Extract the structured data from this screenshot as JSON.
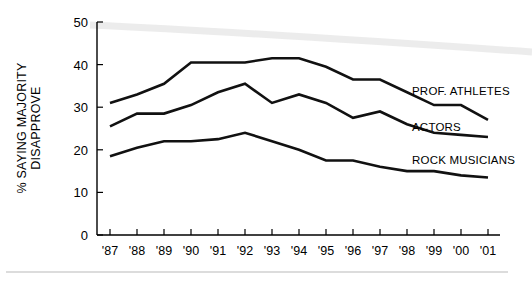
{
  "chart_data": {
    "type": "line",
    "title": "",
    "subtitle": "",
    "xlabel": "",
    "ylabel": "% SAYING MAJORITY DISAPPROVE",
    "ylabel_line1": "% SAYING MAJORITY",
    "ylabel_line2": "DISAPPROVE",
    "categories": [
      "'87",
      "'88",
      "'89",
      "'90",
      "'91",
      "'92",
      "'93",
      "'94",
      "'95",
      "'96",
      "'97",
      "'98",
      "'99",
      "'00",
      "'01"
    ],
    "ylim": [
      0,
      50
    ],
    "xlim_labels": [
      "'87",
      "'01"
    ],
    "yticks": [
      0,
      10,
      20,
      30,
      40,
      50
    ],
    "ytick_labels": [
      "0",
      "10",
      "20",
      "30",
      "40",
      "50"
    ],
    "grid": false,
    "legend_position": "right-inline-end-of-line",
    "series": [
      {
        "name": "PROF. ATHLETES",
        "color": "#111111",
        "values": [
          31,
          33,
          35.5,
          40.5,
          40.5,
          40.5,
          41.5,
          41.5,
          39.5,
          36.5,
          36.5,
          33.5,
          30.5,
          30.5,
          27
        ]
      },
      {
        "name": "ACTORS",
        "color": "#111111",
        "values": [
          25.5,
          28.5,
          28.5,
          30.5,
          33.5,
          35.5,
          31,
          33,
          31,
          27.5,
          29,
          26,
          24,
          23.5,
          23
        ]
      },
      {
        "name": "ROCK MUSICIANS",
        "color": "#111111",
        "values": [
          18.5,
          20.5,
          22,
          22,
          22.5,
          24,
          22,
          20,
          17.5,
          17.5,
          16,
          15,
          15,
          14,
          13.5
        ]
      }
    ]
  },
  "axis": {
    "y_tick_labels": [
      "50",
      "40",
      "30",
      "20",
      "10",
      "0"
    ],
    "x_tick_labels": [
      "'87",
      "'88",
      "'89",
      "'90",
      "'91",
      "'92",
      "'93",
      "'94",
      "'95",
      "'96",
      "'97",
      "'98",
      "'99",
      "'00",
      "'01"
    ]
  },
  "series_labels": {
    "athletes": "PROF. ATHLETES",
    "actors": "ACTORS",
    "rock": "ROCK MUSICIANS"
  }
}
